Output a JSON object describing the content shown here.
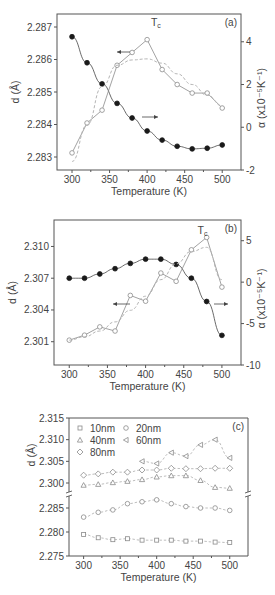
{
  "chart_data": [
    {
      "panel": "(a)",
      "type": "line",
      "xlabel": "Temperature (K)",
      "ylabel": "d (Å)",
      "y2label": "α (x10⁻⁵K⁻¹)",
      "annotation": "Tc",
      "xlim": [
        280,
        525
      ],
      "xticks": [
        300,
        350,
        400,
        450,
        500
      ],
      "ylim": [
        2.2826,
        2.2874
      ],
      "yticks": [
        2.283,
        2.284,
        2.285,
        2.286,
        2.287
      ],
      "y2lim": [
        -2,
        5.3
      ],
      "y2ticks": [
        -2,
        0,
        2,
        4
      ],
      "series": [
        {
          "name": "d",
          "axis": "left",
          "marker": "filled-circle",
          "x": [
            300,
            320,
            340,
            360,
            380,
            400,
            420,
            440,
            460,
            480,
            500
          ],
          "values": [
            2.2867,
            2.2859,
            2.28525,
            2.28465,
            2.2842,
            2.2838,
            2.28352,
            2.28333,
            2.28325,
            2.28327,
            2.28337
          ]
        },
        {
          "name": "alpha",
          "axis": "right",
          "marker": "open-circle",
          "x": [
            300,
            320,
            340,
            360,
            380,
            400,
            420,
            440,
            460,
            480,
            500
          ],
          "values": [
            -1.2,
            0.2,
            0.8,
            2.9,
            3.5,
            4.1,
            2.7,
            2.0,
            1.6,
            1.6,
            0.9
          ]
        },
        {
          "name": "alpha-fit",
          "axis": "right",
          "style": "dashed",
          "x": [
            300,
            320,
            340,
            360,
            380,
            400,
            420,
            440,
            460,
            480,
            500
          ],
          "values": [
            -1.6,
            0.1,
            1.9,
            2.9,
            3.15,
            3.2,
            3.0,
            2.5,
            2.0,
            1.5,
            1.0
          ]
        }
      ],
      "arrows": [
        {
          "direction": "left",
          "near": "alpha"
        },
        {
          "direction": "right",
          "near": "d"
        }
      ]
    },
    {
      "panel": "(b)",
      "type": "line",
      "xlabel": "Temperature (K)",
      "ylabel": "d (Å)",
      "y2label": "α (x10⁻⁵K⁻¹)",
      "annotation": "Tc",
      "xlim": [
        280,
        525
      ],
      "xticks": [
        300,
        350,
        400,
        450,
        500
      ],
      "ylim": [
        2.2988,
        2.3125
      ],
      "yticks": [
        2.301,
        2.304,
        2.307,
        2.31
      ],
      "y2lim": [
        -10,
        7.5
      ],
      "y2ticks": [
        -10,
        -5,
        0,
        5
      ],
      "series": [
        {
          "name": "d",
          "axis": "left",
          "marker": "filled-circle",
          "x": [
            300,
            320,
            340,
            360,
            380,
            400,
            420,
            440,
            460,
            480,
            500
          ],
          "values": [
            2.307,
            2.307,
            2.3074,
            2.3079,
            2.3084,
            2.3088,
            2.3088,
            2.3083,
            2.307,
            2.3048,
            2.3016
          ]
        },
        {
          "name": "alpha",
          "axis": "right",
          "marker": "open-circle",
          "x": [
            300,
            320,
            340,
            360,
            380,
            400,
            420,
            440,
            460,
            480,
            500
          ],
          "values": [
            -7.0,
            -6.4,
            -5.4,
            -5.9,
            -1.6,
            -2.3,
            1.1,
            0.1,
            3.9,
            5.4,
            -0.6
          ]
        },
        {
          "name": "alpha-fit",
          "axis": "right",
          "style": "dashed",
          "x": [
            300,
            320,
            340,
            360,
            380,
            400,
            420,
            440,
            460,
            480,
            500
          ],
          "values": [
            -7.0,
            -6.6,
            -5.9,
            -4.8,
            -3.4,
            -1.7,
            0.3,
            2.2,
            3.7,
            4.2,
            0.3
          ]
        }
      ],
      "arrows": [
        {
          "direction": "left",
          "near": "alpha"
        },
        {
          "direction": "right",
          "near": "d"
        }
      ]
    },
    {
      "panel": "(c)",
      "type": "scatter",
      "xlabel": "Temperature (K)",
      "ylabel": "d (Å)",
      "xlim": [
        280,
        525
      ],
      "xticks": [
        300,
        350,
        400,
        450,
        500
      ],
      "ylim_upper": [
        2.2985,
        2.315
      ],
      "yticks_upper": [
        2.3,
        2.305,
        2.31,
        2.315
      ],
      "ylim_lower": [
        2.275,
        2.2895
      ],
      "yticks_lower": [
        2.275,
        2.28,
        2.285
      ],
      "axis_break": true,
      "legend": [
        "10nm",
        "20nm",
        "40nm",
        "60nm",
        "80nm"
      ],
      "series": [
        {
          "name": "10nm",
          "marker": "square",
          "x": [
            300,
            320,
            340,
            360,
            380,
            400,
            420,
            440,
            460,
            480,
            500
          ],
          "values": [
            2.2795,
            2.2788,
            2.2784,
            2.2786,
            2.2783,
            2.2783,
            2.2783,
            2.2781,
            2.2781,
            2.2779,
            2.2778
          ]
        },
        {
          "name": "20nm",
          "marker": "circle",
          "x": [
            300,
            320,
            340,
            360,
            380,
            400,
            420,
            440,
            460,
            480,
            500
          ],
          "values": [
            2.2831,
            2.2841,
            2.2846,
            2.2859,
            2.2863,
            2.2867,
            2.2859,
            2.2853,
            2.285,
            2.285,
            2.2845
          ]
        },
        {
          "name": "40nm",
          "marker": "triangle-up",
          "x": [
            300,
            320,
            340,
            360,
            380,
            400,
            420,
            440,
            460,
            480,
            500
          ],
          "values": [
            2.2995,
            2.2997,
            2.3001,
            2.3004,
            2.3008,
            2.3014,
            2.3017,
            2.3017,
            2.3006,
            2.299,
            2.2988
          ]
        },
        {
          "name": "60nm",
          "marker": "triangle-left",
          "x": [
            380,
            400,
            420,
            440,
            460,
            480,
            500
          ],
          "values": [
            2.305,
            2.3045,
            2.307,
            2.3062,
            2.3088,
            2.31,
            2.3058
          ]
        },
        {
          "name": "80nm",
          "marker": "diamond",
          "x": [
            300,
            320,
            340,
            360,
            380,
            400,
            420,
            440,
            460,
            480,
            500
          ],
          "values": [
            2.3018,
            2.3021,
            2.3025,
            2.3025,
            2.303,
            2.303,
            2.3034,
            2.3033,
            2.3033,
            2.3034,
            2.3034
          ]
        }
      ]
    }
  ],
  "colors": {
    "axis": "#555555",
    "dark": "#1a1a1a",
    "gray": "#8a8a8a",
    "light": "#b5b5b5"
  }
}
